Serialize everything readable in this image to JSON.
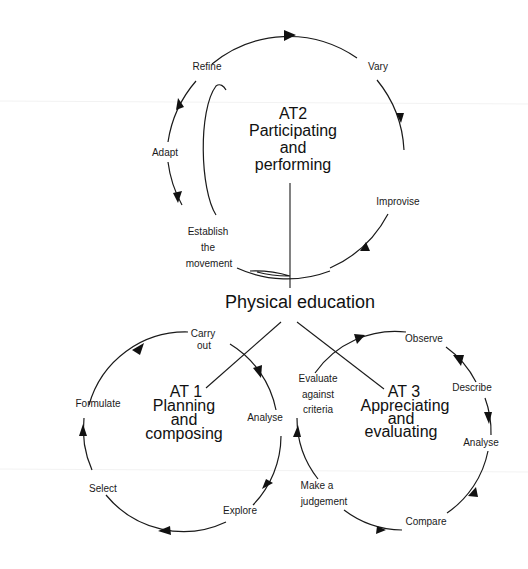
{
  "title": "Physical education",
  "colors": {
    "ink": "#111111",
    "background": "#ffffff"
  },
  "cycles": {
    "at2": {
      "heading": [
        "AT2",
        "Participating",
        "and",
        "performing"
      ],
      "steps": {
        "refine": "Refine",
        "vary": "Vary",
        "improvise": "Improvise",
        "establish": [
          "Establish",
          "the",
          "movement"
        ],
        "adapt": "Adapt"
      }
    },
    "at1": {
      "heading": [
        "AT 1",
        "Planning",
        "and",
        "composing"
      ],
      "steps": {
        "carry_out": [
          "Carry",
          "out"
        ],
        "analyse": "Analyse",
        "explore": "Explore",
        "select": "Select",
        "formulate": "Formulate"
      }
    },
    "at3": {
      "heading": [
        "AT 3",
        "Appreciating",
        "and",
        "evaluating"
      ],
      "steps": {
        "observe": "Observe",
        "describe": "Describe",
        "analyse": "Analyse",
        "compare": "Compare",
        "make_judgement": [
          "Make a",
          "judgement"
        ],
        "evaluate": [
          "Evaluate",
          "against",
          "criteria"
        ]
      }
    }
  }
}
